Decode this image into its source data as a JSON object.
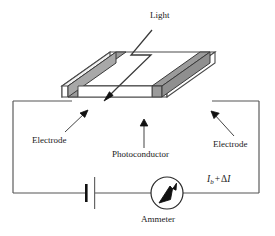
{
  "figure": {
    "background_color": "#ffffff",
    "line_color": "#3a3a3a",
    "ink_color": "#1a1a1a",
    "electrode_fill": "#9b9b9b",
    "electrode_fill_light": "#b4b4b4",
    "slab_top_fill": "#ffffff",
    "slab_front_fill": "#ffffff"
  },
  "labels": {
    "light": "Light",
    "electrode_left": "Electrode",
    "photoconductor": "Photoconductor",
    "electrode_right": "Electrode",
    "ammeter": "Ammeter",
    "current_symbol": "I",
    "current_subscript": "b",
    "current_operator": "+",
    "current_delta": "Δ",
    "current_delta_symbol": "I",
    "current_full": "Ib + ΔI"
  },
  "components": {
    "battery": "battery-symbol",
    "ammeter": "ammeter-meter",
    "slab": "photoconductor-slab",
    "light_ray": "zigzag-light-arrow",
    "wire_loop": "circuit-wire-loop"
  }
}
